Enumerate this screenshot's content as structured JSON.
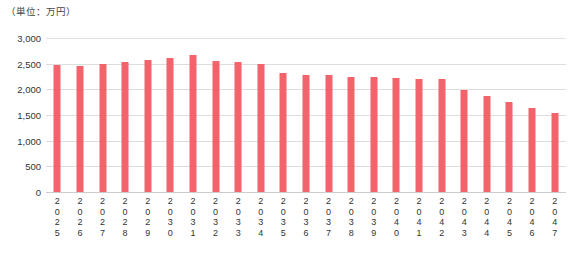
{
  "chart_data": {
    "type": "bar",
    "title": "",
    "subtitle": "",
    "unit_caption": "（単位：万円）",
    "xlabel": "",
    "ylabel": "",
    "ylim": [
      0,
      3000
    ],
    "ytick_labels": [
      "3,000",
      "2,500",
      "2,000",
      "1,500",
      "1,000",
      "500",
      "0"
    ],
    "ytick_values": [
      3000,
      2500,
      2000,
      1500,
      1000,
      500,
      0
    ],
    "grid": true,
    "legend": "none",
    "bar_color": "#F2636B",
    "gridline_color": "#DDDDDD",
    "categories": [
      "2025",
      "2026",
      "2027",
      "2028",
      "2029",
      "2030",
      "2031",
      "2032",
      "2033",
      "2034",
      "2035",
      "2036",
      "2037",
      "2038",
      "2039",
      "2040",
      "2041",
      "2042",
      "2043",
      "2044",
      "2045",
      "2046",
      "2047"
    ],
    "values": [
      2470,
      2460,
      2500,
      2540,
      2580,
      2620,
      2670,
      2560,
      2540,
      2500,
      2320,
      2280,
      2270,
      2250,
      2240,
      2230,
      2210,
      2200,
      1990,
      1870,
      1760,
      1630,
      1530
    ]
  }
}
